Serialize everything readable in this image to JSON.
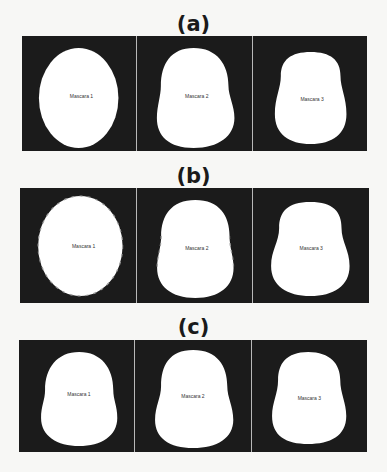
{
  "figure": {
    "panels": [
      {
        "title": "(a)",
        "masks": [
          {
            "label": "Mascara 1"
          },
          {
            "label": "Mascara 2"
          },
          {
            "label": "Mascara 3"
          }
        ]
      },
      {
        "title": "(b)",
        "masks": [
          {
            "label": "Mascara 1"
          },
          {
            "label": "Mascara 2"
          },
          {
            "label": "Mascara 3"
          }
        ]
      },
      {
        "title": "(c)",
        "masks": [
          {
            "label": "Mascara 1"
          },
          {
            "label": "Mascara 2"
          },
          {
            "label": "Mascara 3"
          }
        ]
      }
    ],
    "colors": {
      "background": "#1b1b1b",
      "mask": "#ffffff",
      "divider": "#b8b8b8"
    }
  }
}
